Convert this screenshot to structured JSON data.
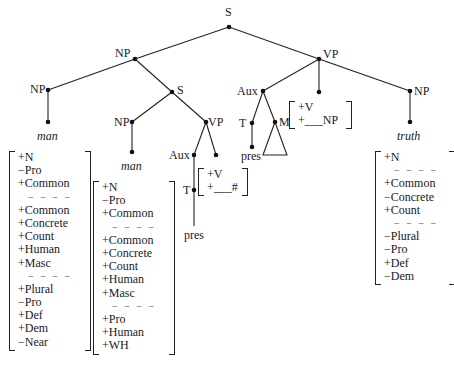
{
  "tree": {
    "root": "S",
    "subject_np": "NP",
    "predicate_vp": "VP",
    "head_np": "NP",
    "head_word": "man",
    "rel_s": "S",
    "rel_np": "NP",
    "rel_word": "man",
    "rel_vp": "VP",
    "rel_aux": "Aux",
    "rel_t": "T",
    "rel_pres": "pres",
    "main_aux": "Aux",
    "main_t": "T",
    "main_pres": "pres",
    "main_m": "M",
    "obj_np": "NP",
    "obj_word": "truth"
  },
  "matrices": {
    "head_man": [
      "+N",
      "−Pro",
      "+Common",
      "----",
      "+Common",
      "+Concrete",
      "+Count",
      "+Human",
      "+Masc",
      "----",
      "+Plural",
      "−Pro",
      "+Def",
      "+Dem",
      "−Near"
    ],
    "rel_man": [
      "+N",
      "−Pro",
      "+Common",
      "----",
      "+Common",
      "+Concrete",
      "+Count",
      "+Human",
      "+Masc",
      "----",
      "+Pro",
      "+Human",
      "+WH"
    ],
    "rel_verb": [
      "+V",
      "+___#"
    ],
    "main_verb": [
      "+V",
      "+___NP"
    ],
    "truth": [
      "+N",
      "----",
      "+Common",
      "−Concrete",
      "+Count",
      "----",
      "−Plural",
      "−Pro",
      "+Def",
      "−Dem"
    ]
  }
}
